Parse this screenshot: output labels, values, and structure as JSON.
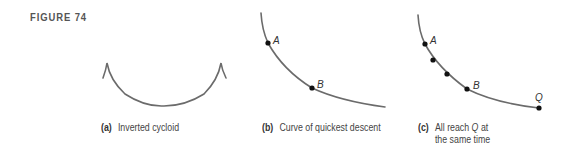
{
  "figure": {
    "label": "FIGURE 74",
    "curve_color": "#6b6b6b",
    "dot_color": "#111111"
  },
  "panels": [
    {
      "id": "a",
      "tag": "(a)",
      "caption": "Inverted cycloid",
      "points": []
    },
    {
      "id": "b",
      "tag": "(b)",
      "caption": "Curve of quickest descent",
      "points": [
        {
          "label": "A",
          "x": 268,
          "y": 43
        },
        {
          "label": "B",
          "x": 312,
          "y": 88
        }
      ]
    },
    {
      "id": "c",
      "tag": "(c)",
      "caption_line1": "All reach",
      "caption_italic": "Q",
      "caption_line1_end": "at",
      "caption_line2": "the same time",
      "points": [
        {
          "label": "A",
          "x": 425,
          "y": 44
        },
        {
          "label": "",
          "x": 433,
          "y": 60
        },
        {
          "label": "",
          "x": 447,
          "y": 74
        },
        {
          "label": "B",
          "x": 467,
          "y": 89
        },
        {
          "label": "Q",
          "x": 539,
          "y": 108
        }
      ]
    }
  ]
}
